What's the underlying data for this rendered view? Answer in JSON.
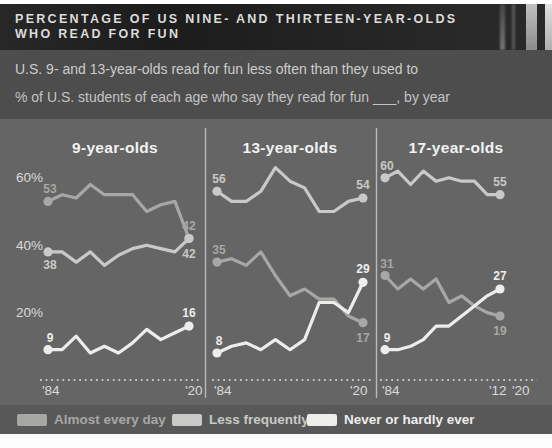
{
  "header": {
    "title_line1": "PERCENTAGE OF US NINE- AND THIRTEEN-YEAR-OLDS",
    "title_line2": "WHO READ FOR FUN"
  },
  "subtitle": {
    "line1": "U.S. 9- and 13-year-olds read for fun less often than they used to",
    "line2": "% of U.S. students of each age who say they read for fun ___, by year"
  },
  "colors": {
    "almost_every_day": "#a7a7a5",
    "less_frequently": "#c9c9c7",
    "never_or_hardly_ever": "#ededeb",
    "chart_background": "#656565",
    "banner_background": "#1c1c1c"
  },
  "chart_data": {
    "type": "line",
    "ylim": [
      0,
      68
    ],
    "y_axis": {
      "ticks": [
        {
          "label": "60%",
          "value": 60
        },
        {
          "label": "40%",
          "value": 40
        },
        {
          "label": "20%",
          "value": 20
        }
      ]
    },
    "legend": [
      {
        "label": "Almost every day",
        "color": "#a7a7a5"
      },
      {
        "label": "Less frequently",
        "color": "#c9c9c7"
      },
      {
        "label": "Never or hardly ever",
        "color": "#ededeb"
      }
    ],
    "panels": [
      {
        "title": "9-year-olds",
        "years": [
          1984,
          1988,
          1990,
          1992,
          1994,
          1996,
          1999,
          2004,
          2008,
          2012,
          2020
        ],
        "x_tick_labels": [
          "'84",
          "'20"
        ],
        "series": [
          {
            "name": "Almost every day",
            "values": [
              53,
              55,
              54,
              58,
              55,
              55,
              55,
              50,
              52,
              53,
              42
            ],
            "start_side": "above",
            "end_side": "above"
          },
          {
            "name": "Less frequently",
            "values": [
              38,
              38,
              35,
              38,
              34,
              37,
              39,
              40,
              39,
              38,
              42
            ],
            "start_side": "below",
            "end_side": "below"
          },
          {
            "name": "Never or hardly ever",
            "values": [
              9,
              9,
              13,
              8,
              10,
              8,
              11,
              15,
              12,
              14,
              16
            ],
            "start_side": "above",
            "end_side": "above"
          }
        ]
      },
      {
        "title": "13-year-olds",
        "years": [
          1984,
          1988,
          1990,
          1992,
          1994,
          1996,
          1999,
          2004,
          2008,
          2012,
          2020
        ],
        "x_tick_labels": [
          "'84",
          "'20"
        ],
        "series": [
          {
            "name": "Less frequently",
            "values": [
              56,
              53,
              53,
              56,
              63,
              59,
              57,
              50,
              50,
              53,
              54
            ],
            "start_side": "above",
            "end_side": "above"
          },
          {
            "name": "Almost every day",
            "values": [
              35,
              36,
              34,
              38,
              31,
              25,
              27,
              24,
              24,
              19,
              17
            ],
            "start_side": "above",
            "end_side": "below"
          },
          {
            "name": "Never or hardly ever",
            "values": [
              8,
              10,
              11,
              9,
              12,
              9,
              12,
              23,
              23,
              20,
              29
            ],
            "start_side": "above",
            "end_side": "above"
          }
        ]
      },
      {
        "title": "17-year-olds",
        "years": [
          1984,
          1988,
          1990,
          1992,
          1994,
          1996,
          1999,
          2004,
          2008,
          2012
        ],
        "x_tick_labels": [
          "'84",
          "'12",
          "'20"
        ],
        "series": [
          {
            "name": "Less frequently",
            "values": [
              60,
              62,
              58,
              62,
              59,
              60,
              59,
              59,
              55,
              55
            ],
            "start_side": "above",
            "end_side": "above"
          },
          {
            "name": "Almost every day",
            "values": [
              31,
              27,
              30,
              27,
              30,
              23,
              25,
              22,
              20,
              19
            ],
            "start_side": "above",
            "end_side": "below"
          },
          {
            "name": "Never or hardly ever",
            "values": [
              9,
              9,
              10,
              12,
              16,
              16,
              19,
              22,
              25,
              27
            ],
            "start_side": "above",
            "end_side": "above"
          }
        ]
      }
    ]
  }
}
